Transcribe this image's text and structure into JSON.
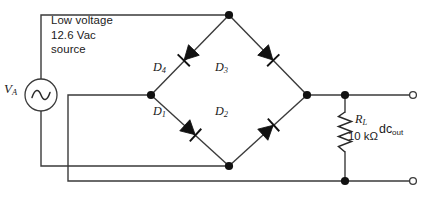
{
  "figure": {
    "type": "full-wave-bridge-rectifier-schematic",
    "source_note": {
      "line1": "Low voltage",
      "line2": "12.6 Vac",
      "line3": "source"
    },
    "source": {
      "label_symbol": "V",
      "label_subscript": "A",
      "icon": "ac-source-sine-icon"
    },
    "diodes": [
      {
        "id": "D1",
        "name": "D",
        "subscript": "1"
      },
      {
        "id": "D2",
        "name": "D",
        "subscript": "2"
      },
      {
        "id": "D3",
        "name": "D",
        "subscript": "3"
      },
      {
        "id": "D4",
        "name": "D",
        "subscript": "4"
      }
    ],
    "load": {
      "symbol": "R",
      "subscript": "L",
      "value": "10 kΩ"
    },
    "output": {
      "label": "dc",
      "subscript": "out"
    },
    "colors": {
      "wire": "#3a3a3a",
      "ink": "#111111",
      "background": "#ffffff"
    }
  }
}
